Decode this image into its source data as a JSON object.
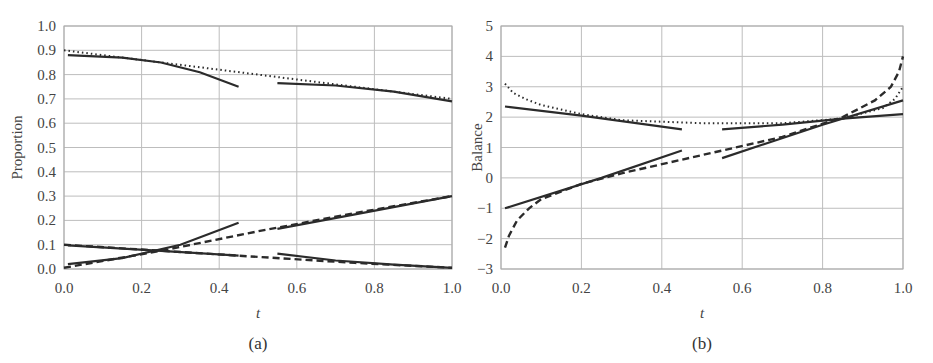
{
  "chart_data": [
    {
      "type": "line",
      "panel_label": "(a)",
      "xlabel": "t",
      "ylabel": "Proportion",
      "xlim": [
        0.0,
        1.0
      ],
      "ylim": [
        0.0,
        1.0
      ],
      "xticks": [
        "0.0",
        "0.2",
        "0.4",
        "0.6",
        "0.8",
        "1.0"
      ],
      "yticks": [
        "0.0",
        "0.1",
        "0.2",
        "0.3",
        "0.4",
        "0.5",
        "0.6",
        "0.7",
        "0.8",
        "0.9",
        "1.0"
      ],
      "grid": true,
      "series": [
        {
          "name": "upper-dotted",
          "style": "dotted",
          "x": [
            0.0,
            0.2,
            0.4,
            0.6,
            0.8,
            1.0
          ],
          "y": [
            0.9,
            0.86,
            0.82,
            0.78,
            0.74,
            0.7
          ]
        },
        {
          "name": "upper-solid-left",
          "style": "solid",
          "x": [
            0.01,
            0.15,
            0.25,
            0.35,
            0.45
          ],
          "y": [
            0.88,
            0.87,
            0.85,
            0.81,
            0.75
          ]
        },
        {
          "name": "upper-solid-right",
          "style": "solid",
          "x": [
            0.55,
            0.7,
            0.85,
            1.0
          ],
          "y": [
            0.765,
            0.755,
            0.73,
            0.69
          ]
        },
        {
          "name": "rising-dashed",
          "style": "dashed",
          "x": [
            0.0,
            0.25,
            0.5,
            0.75,
            1.0
          ],
          "y": [
            0.005,
            0.075,
            0.155,
            0.23,
            0.3
          ]
        },
        {
          "name": "rising-solid-left",
          "style": "solid",
          "x": [
            0.01,
            0.15,
            0.3,
            0.45
          ],
          "y": [
            0.02,
            0.045,
            0.1,
            0.19
          ]
        },
        {
          "name": "rising-solid-right",
          "style": "solid",
          "x": [
            0.55,
            0.75,
            1.0
          ],
          "y": [
            0.165,
            0.225,
            0.3
          ]
        },
        {
          "name": "falling-dashed",
          "style": "dashed",
          "x": [
            0.0,
            0.25,
            0.5,
            0.75,
            1.0
          ],
          "y": [
            0.1,
            0.075,
            0.05,
            0.025,
            0.005
          ]
        },
        {
          "name": "falling-solid-left",
          "style": "solid",
          "x": [
            0.01,
            0.25,
            0.45
          ],
          "y": [
            0.097,
            0.075,
            0.055
          ]
        },
        {
          "name": "falling-solid-right",
          "style": "solid",
          "x": [
            0.55,
            0.7,
            0.85,
            1.0
          ],
          "y": [
            0.063,
            0.035,
            0.018,
            0.005
          ]
        }
      ]
    },
    {
      "type": "line",
      "panel_label": "(b)",
      "xlabel": "t",
      "ylabel": "Balance",
      "xlim": [
        0.0,
        1.0
      ],
      "ylim": [
        -3,
        5
      ],
      "xticks": [
        "0.0",
        "0.2",
        "0.4",
        "0.6",
        "0.8",
        "1.0"
      ],
      "yticks": [
        "-3",
        "-2",
        "-1",
        "0",
        "1",
        "2",
        "3",
        "4",
        "5"
      ],
      "grid": true,
      "series": [
        {
          "name": "upper-dotted",
          "style": "dotted",
          "x": [
            0.01,
            0.03,
            0.06,
            0.1,
            0.2,
            0.3,
            0.5,
            0.7,
            0.85,
            0.95,
            0.98,
            1.0
          ],
          "y": [
            3.1,
            2.8,
            2.6,
            2.4,
            2.1,
            1.9,
            1.8,
            1.8,
            1.95,
            2.3,
            2.6,
            3.0
          ]
        },
        {
          "name": "upper-solid-left",
          "style": "solid",
          "x": [
            0.01,
            0.2,
            0.45
          ],
          "y": [
            2.35,
            2.05,
            1.6
          ]
        },
        {
          "name": "upper-solid-right",
          "style": "solid",
          "x": [
            0.55,
            0.7,
            0.85,
            1.0
          ],
          "y": [
            1.6,
            1.75,
            1.95,
            2.1
          ]
        },
        {
          "name": "lower-dashed",
          "style": "dashed",
          "x": [
            0.01,
            0.02,
            0.04,
            0.07,
            0.1,
            0.2,
            0.3,
            0.5,
            0.7,
            0.85,
            0.93,
            0.97,
            0.99,
            1.0
          ],
          "y": [
            -2.3,
            -1.9,
            -1.4,
            -1.0,
            -0.7,
            -0.2,
            0.15,
            0.75,
            1.35,
            2.0,
            2.55,
            3.0,
            3.5,
            4.0
          ]
        },
        {
          "name": "lower-solid-left",
          "style": "solid",
          "x": [
            0.01,
            0.25,
            0.45
          ],
          "y": [
            -1.0,
            0.0,
            0.9
          ]
        },
        {
          "name": "lower-solid-right",
          "style": "solid",
          "x": [
            0.55,
            0.8,
            1.0
          ],
          "y": [
            0.65,
            1.75,
            2.55
          ]
        }
      ]
    }
  ]
}
